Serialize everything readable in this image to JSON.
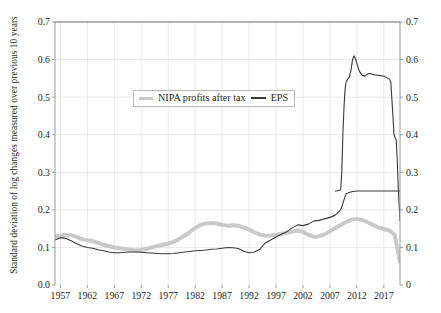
{
  "axes": {
    "y_label": "Standard deviation of log changes measured over previous 10 years",
    "y_left_ticks": [
      "0.7",
      "0.6",
      "0.5",
      "0.4",
      "0.3",
      "0.2",
      "0.1",
      "0.0"
    ],
    "y_right_ticks": [
      "0.7",
      "0.6",
      "0.5",
      "0.4",
      "0.3",
      "0.2",
      "0.1",
      "0"
    ],
    "x_ticks": [
      "1957",
      "1962",
      "1967",
      "1972",
      "1977",
      "1982",
      "1987",
      "1992",
      "1997",
      "2002",
      "2007",
      "2012",
      "2017"
    ]
  },
  "legend": {
    "items": [
      {
        "label": "NIPA profits after tax",
        "color": "#c9c9c9",
        "style": "thick-grey"
      },
      {
        "label": "EPS",
        "color": "#3a3a3a",
        "style": "thin-dark"
      }
    ]
  },
  "chart_data": {
    "type": "line",
    "title": "",
    "xlabel": "",
    "ylabel": "Standard deviation of log changes measured over previous 10 years",
    "xlim": [
      1956,
      2020
    ],
    "ylim": [
      0,
      0.7
    ],
    "grid": true,
    "legend_position": "upper-center",
    "x": [
      1956,
      1957,
      1958,
      1959,
      1960,
      1961,
      1962,
      1963,
      1964,
      1965,
      1966,
      1967,
      1968,
      1969,
      1970,
      1971,
      1972,
      1973,
      1974,
      1975,
      1976,
      1977,
      1978,
      1979,
      1980,
      1981,
      1982,
      1983,
      1984,
      1985,
      1986,
      1987,
      1988,
      1989,
      1990,
      1991,
      1992,
      1993,
      1994,
      1995,
      1996,
      1997,
      1998,
      1999,
      2000,
      2001,
      2002,
      2003,
      2004,
      2005,
      2006,
      2007,
      2008,
      2009,
      2010,
      2011,
      2012,
      2013,
      2014,
      2015,
      2016,
      2017,
      2018,
      2019,
      2020
    ],
    "series": [
      {
        "name": "NIPA profits after tax",
        "color": "#c9c9c9",
        "linewidth": 4,
        "values": [
          0.13,
          0.131,
          0.134,
          0.133,
          0.128,
          0.122,
          0.119,
          0.117,
          0.112,
          0.107,
          0.103,
          0.1,
          0.098,
          0.096,
          0.094,
          0.092,
          0.093,
          0.096,
          0.1,
          0.104,
          0.107,
          0.11,
          0.115,
          0.122,
          0.131,
          0.141,
          0.152,
          0.16,
          0.164,
          0.165,
          0.164,
          0.16,
          0.158,
          0.159,
          0.158,
          0.153,
          0.148,
          0.14,
          0.134,
          0.131,
          0.132,
          0.134,
          0.136,
          0.139,
          0.142,
          0.145,
          0.142,
          0.134,
          0.128,
          0.13,
          0.135,
          0.143,
          0.152,
          0.16,
          0.168,
          0.174,
          0.176,
          0.173,
          0.167,
          0.16,
          0.153,
          0.149,
          0.145,
          0.134,
          0.062
        ]
      },
      {
        "name": "EPS",
        "color": "#3a3a3a",
        "linewidth": 1.1,
        "values": [
          0.12,
          0.126,
          0.124,
          0.118,
          0.11,
          0.104,
          0.1,
          0.098,
          0.094,
          0.091,
          0.088,
          0.086,
          0.086,
          0.087,
          0.088,
          0.088,
          0.087,
          0.086,
          0.085,
          0.084,
          0.083,
          0.083,
          0.084,
          0.086,
          0.088,
          0.089,
          0.091,
          0.092,
          0.093,
          0.095,
          0.096,
          0.098,
          0.1,
          0.099,
          0.097,
          0.09,
          0.086,
          0.088,
          0.095,
          0.112,
          0.12,
          0.128,
          0.135,
          0.142,
          0.152,
          0.16,
          0.158,
          0.162,
          0.17,
          0.172,
          0.176,
          0.18,
          0.186,
          0.2,
          0.243,
          0.248,
          0.25,
          0.25,
          0.25,
          0.25,
          0.25,
          0.25,
          0.25,
          0.25,
          0.25
        ]
      },
      {
        "name": "EPS-late",
        "color": "#3a3a3a",
        "linewidth": 1.1,
        "x": [
          2008.0,
          2008.4,
          2008.7,
          2009.0,
          2009.2,
          2009.4,
          2009.6,
          2009.8,
          2010.0,
          2010.3,
          2010.6,
          2010.9,
          2011.2,
          2011.5,
          2011.8,
          2012.1,
          2012.5,
          2013.0,
          2013.5,
          2014.0,
          2014.5,
          2015.0,
          2015.5,
          2016.0,
          2016.5,
          2017.0,
          2017.5,
          2018.0,
          2018.3,
          2018.6,
          2018.9,
          2019.1,
          2019.3,
          2019.5,
          2019.7,
          2019.9,
          2020.0
        ],
        "values": [
          0.25,
          0.251,
          0.252,
          0.253,
          0.3,
          0.4,
          0.47,
          0.52,
          0.54,
          0.548,
          0.553,
          0.572,
          0.6,
          0.61,
          0.6,
          0.585,
          0.568,
          0.558,
          0.556,
          0.562,
          0.563,
          0.56,
          0.559,
          0.558,
          0.557,
          0.556,
          0.552,
          0.548,
          0.54,
          0.47,
          0.4,
          0.392,
          0.385,
          0.33,
          0.25,
          0.2,
          0.172
        ]
      }
    ],
    "annotations": [
      {
        "text": "EPS peak",
        "x": 2011.5,
        "y": 0.61
      },
      {
        "text": "NIPA peak",
        "x": 2012,
        "y": 0.176
      },
      {
        "text": "Sharp EPS rise begins",
        "x": 2009,
        "y": 0.25
      }
    ]
  }
}
